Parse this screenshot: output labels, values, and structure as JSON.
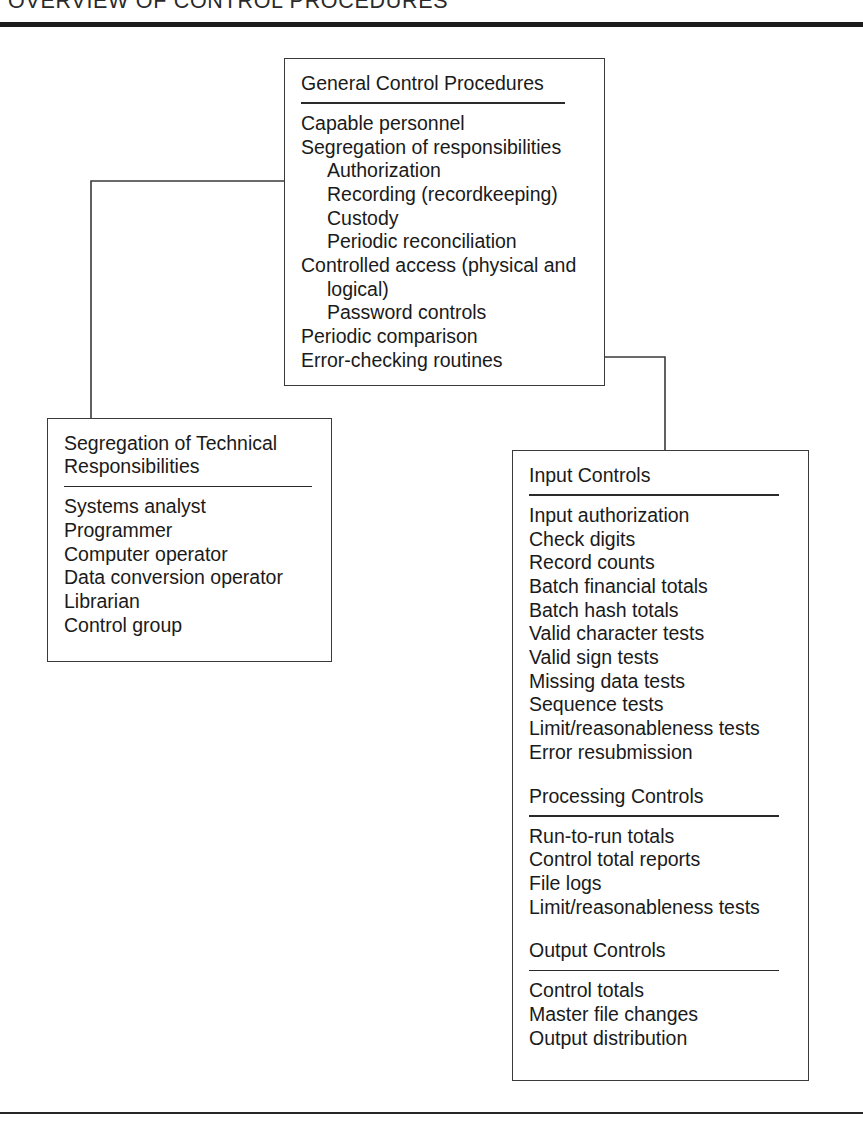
{
  "figure": {
    "title": "OVERVIEW OF CONTROL PROCEDURES",
    "rule_color": "#1c1c1c",
    "box_border_color": "#3a3a3a",
    "connector_color": "#3a3a3a",
    "background": "#ffffff",
    "text_color": "#1a1a1a"
  },
  "panels": {
    "general": {
      "heading": "General Control Procedures",
      "items": [
        {
          "text": "Capable personnel",
          "indent": 0
        },
        {
          "text": "Segregation of responsibilities",
          "indent": 0
        },
        {
          "text": "Authorization",
          "indent": 1
        },
        {
          "text": "Recording (recordkeeping)",
          "indent": 1
        },
        {
          "text": "Custody",
          "indent": 1
        },
        {
          "text": "Periodic reconciliation",
          "indent": 1
        },
        {
          "text": "Controlled access (physical and logical)",
          "indent": 0,
          "hanging": true
        },
        {
          "text": "Password controls",
          "indent": 1
        },
        {
          "text": "Periodic comparison",
          "indent": 0
        },
        {
          "text": "Error-checking routines",
          "indent": 0
        }
      ]
    },
    "segregation": {
      "heading": "Segregation of Technical\nResponsibilities",
      "items": [
        {
          "text": "Systems analyst",
          "indent": 0
        },
        {
          "text": "Programmer",
          "indent": 0
        },
        {
          "text": "Computer operator",
          "indent": 0
        },
        {
          "text": "Data conversion operator",
          "indent": 0
        },
        {
          "text": "Librarian",
          "indent": 0
        },
        {
          "text": "Control group",
          "indent": 0
        }
      ]
    },
    "application": {
      "sections": [
        {
          "heading": "Input Controls",
          "items": [
            {
              "text": "Input authorization",
              "indent": 0
            },
            {
              "text": "Check digits",
              "indent": 0
            },
            {
              "text": "Record counts",
              "indent": 0
            },
            {
              "text": "Batch financial totals",
              "indent": 0
            },
            {
              "text": "Batch hash totals",
              "indent": 0
            },
            {
              "text": "Valid character tests",
              "indent": 0
            },
            {
              "text": "Valid sign tests",
              "indent": 0
            },
            {
              "text": "Missing data tests",
              "indent": 0
            },
            {
              "text": "Sequence tests",
              "indent": 0
            },
            {
              "text": "Limit/reasonableness tests",
              "indent": 0
            },
            {
              "text": "Error resubmission",
              "indent": 0
            }
          ]
        },
        {
          "heading": "Processing Controls",
          "items": [
            {
              "text": "Run-to-run totals",
              "indent": 0
            },
            {
              "text": "Control total reports",
              "indent": 0
            },
            {
              "text": "File logs",
              "indent": 0
            },
            {
              "text": "Limit/reasonableness tests",
              "indent": 0
            }
          ]
        },
        {
          "heading": "Output Controls",
          "items": [
            {
              "text": "Control totals",
              "indent": 0
            },
            {
              "text": "Master file changes",
              "indent": 0
            },
            {
              "text": "Output distribution",
              "indent": 0
            }
          ]
        }
      ]
    }
  },
  "connectors": [
    {
      "name": "general-to-segregation",
      "from": "general-left-edge",
      "to": "segregation-top-edge",
      "path": "M 284 181 L 91 181 L 91 418"
    },
    {
      "name": "general-to-application",
      "from": "general-right-edge",
      "to": "application-top-edge",
      "path": "M 605 357 L 665 357 L 665 450"
    }
  ]
}
